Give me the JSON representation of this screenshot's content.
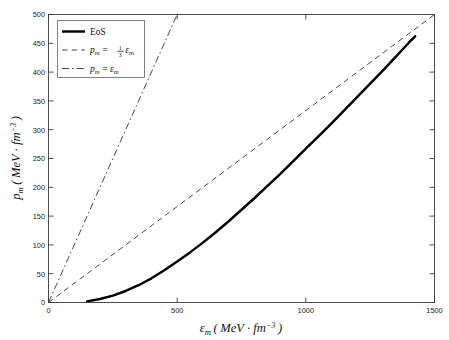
{
  "chart_data": {
    "type": "line",
    "title": "",
    "xlabel": "ε m ( MeV · fm -3 )",
    "ylabel": "p m ( MeV · fm -3 )",
    "xlabel_symbol": "ε",
    "xlabel_sub": "m",
    "ylabel_symbol": "p",
    "ylabel_sub": "m",
    "unit_open": "(",
    "unit_body": "MeV · fm",
    "unit_exp": "−3",
    "unit_close": ")",
    "xlim": [
      0,
      1500
    ],
    "ylim": [
      0,
      500
    ],
    "xticks": [
      0,
      500,
      1000,
      1500
    ],
    "xticklabels": [
      "0",
      "500",
      "1000",
      "1500"
    ],
    "yticks": [
      0,
      50,
      100,
      150,
      200,
      250,
      300,
      350,
      400,
      450,
      500
    ],
    "yticklabels": [
      "0",
      "50",
      "100",
      "150",
      "200",
      "250",
      "300",
      "350",
      "400",
      "450",
      "500"
    ],
    "grid": false,
    "legend_position": "upper-left",
    "series": [
      {
        "name": "EoS",
        "label": "EoS",
        "style": "solid",
        "color": "#000000",
        "x": [
          150,
          200,
          250,
          300,
          350,
          400,
          450,
          500,
          550,
          600,
          650,
          700,
          750,
          800,
          850,
          900,
          950,
          1000,
          1050,
          1100,
          1150,
          1200,
          1250,
          1300,
          1350,
          1400,
          1425
        ],
        "y": [
          2,
          6,
          12,
          20,
          30,
          42,
          56,
          71,
          87,
          104,
          122,
          141,
          161,
          181,
          202,
          223,
          245,
          267,
          289,
          311,
          334,
          357,
          380,
          403,
          427,
          451,
          462
        ]
      },
      {
        "name": "one-third-epsilon",
        "label": "p m = 1/3 ε m",
        "label_lhs": "p",
        "label_lhs_sub": "m",
        "label_eq": "=",
        "label_frac_num": "1",
        "label_frac_den": "3",
        "label_rhs": "ε",
        "label_rhs_sub": "m",
        "style": "dashed",
        "color": "#3d3d3d",
        "slope": 0.3333,
        "x": [
          0,
          1500
        ],
        "y": [
          0,
          500
        ]
      },
      {
        "name": "epsilon",
        "label": "p m = ε m",
        "label_lhs": "p",
        "label_lhs_sub": "m",
        "label_eq": "=",
        "label_rhs": "ε",
        "label_rhs_sub": "m",
        "style": "dash-dot",
        "color": "#3d3d3d",
        "slope": 1.0,
        "x": [
          0,
          500
        ],
        "y": [
          0,
          500
        ]
      }
    ]
  },
  "legend": {
    "entries": [
      {
        "text": "EoS"
      },
      {
        "text": "p m = 1/3 ε m"
      },
      {
        "text": "p m = ε m"
      }
    ]
  }
}
